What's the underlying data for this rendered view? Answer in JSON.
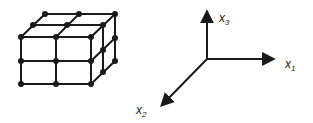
{
  "diagram": {
    "colors": {
      "stroke": "#1a1a1a",
      "background": "#ffffff"
    },
    "lattice": {
      "description": "2x2x1 grid of cells drawn as wireframe box with node dots",
      "nodes_front": [
        [
          21,
          37
        ],
        [
          56,
          37
        ],
        [
          91,
          37
        ],
        [
          21,
          61
        ],
        [
          56,
          61
        ],
        [
          91,
          61
        ],
        [
          21,
          84
        ],
        [
          56,
          84
        ],
        [
          91,
          84
        ]
      ],
      "nodes_mid_top": [
        [
          33,
          25
        ],
        [
          67,
          25
        ],
        [
          103,
          25
        ]
      ],
      "nodes_back_top": [
        [
          45,
          14
        ],
        [
          79,
          14
        ],
        [
          115,
          14
        ]
      ],
      "nodes_right_mid": [
        [
          103,
          50
        ],
        [
          103,
          72
        ]
      ],
      "nodes_right_back": [
        [
          115,
          38
        ],
        [
          115,
          61
        ]
      ]
    },
    "axes": {
      "origin": [
        207,
        59
      ],
      "x1": {
        "label": "x",
        "subscript": "1",
        "tip": [
          275,
          59
        ]
      },
      "x2": {
        "label": "x",
        "subscript": "2",
        "tip": [
          160,
          107
        ]
      },
      "x3": {
        "label": "x",
        "subscript": "3",
        "tip": [
          207,
          10
        ]
      }
    }
  }
}
